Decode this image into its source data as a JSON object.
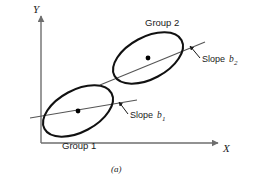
{
  "figure": {
    "caption": "(a)",
    "axes": {
      "y_label": "Y",
      "x_label": "X",
      "origin": [
        41,
        143
      ],
      "y_top": [
        41,
        16
      ],
      "x_right": [
        218,
        143
      ],
      "color": "#6e6e6e"
    },
    "groups": [
      {
        "id": "group-1",
        "label": "Group 1",
        "label_pos": [
          62,
          149
        ],
        "ellipse": {
          "cx": 78,
          "cy": 111,
          "rx": 38,
          "ry": 21,
          "rotation": -28
        },
        "center_dot": [
          78,
          111
        ],
        "regression_line": {
          "x1": 30,
          "y1": 118,
          "x2": 137,
          "y2": 100
        },
        "slope_label": "Slope",
        "slope_var": "b",
        "slope_sub": "1",
        "slope_label_pos": [
          130,
          118
        ],
        "pointer": {
          "x1": 128,
          "y1": 114,
          "x2": 119,
          "y2": 102
        }
      },
      {
        "id": "group-2",
        "label": "Group 2",
        "label_pos": [
          145,
          26
        ],
        "ellipse": {
          "cx": 148,
          "cy": 58,
          "rx": 38,
          "ry": 21,
          "rotation": -28
        },
        "center_dot": [
          148,
          58
        ],
        "regression_line": {
          "x1": 100,
          "y1": 85,
          "x2": 205,
          "y2": 42
        },
        "slope_label": "Slope",
        "slope_var": "b",
        "slope_sub": "2",
        "slope_label_pos": [
          202,
          62
        ],
        "pointer": {
          "x1": 200,
          "y1": 58,
          "x2": 190,
          "y2": 46
        }
      }
    ],
    "colors": {
      "ellipse_stroke": "#111111",
      "line_stroke": "#555555",
      "axis_stroke": "#6e6e6e",
      "dot_fill": "#000000",
      "text": "#1a1a1a",
      "background": "#ffffff"
    }
  }
}
